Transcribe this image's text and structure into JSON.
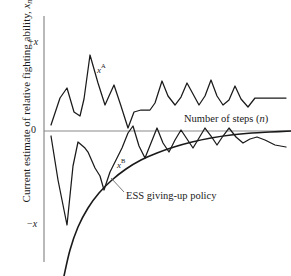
{
  "figure": {
    "background": "#ffffff",
    "line_color": "#1a1a1a",
    "axis_color": "#808080"
  },
  "axes": {
    "y_axis_title": "Current estimate of relative fighting ability, ",
    "y_axis_title_var": "x",
    "y_axis_title_sub": "n",
    "x_axis_title": "Number of steps (",
    "x_axis_title_var": "n",
    "x_axis_title_close": ")",
    "y_ticks": [
      {
        "label_prefix": "+",
        "label_var": "x",
        "value": 1,
        "y_px": 43
      },
      {
        "label_prefix": "",
        "label_var": "0",
        "value": 0,
        "y_px": 131
      },
      {
        "label_prefix": "−",
        "label_var": "x",
        "value": -1,
        "y_px": 225
      }
    ],
    "x_range_px": [
      44,
      291
    ],
    "y_axis_x_px": 44,
    "zero_line_y_px": 131
  },
  "annotations": {
    "series_a_label_var": "x",
    "series_a_label_sup": "A",
    "series_a_label_pos": [
      97,
      62
    ],
    "series_b_label_var": "x",
    "series_b_label_sup": "B",
    "series_b_label_pos": [
      117,
      157
    ],
    "ess_label": "ESS giving-up policy",
    "ess_label_pos": [
      126,
      190
    ],
    "ess_leader_line": [
      [
        124,
        192
      ],
      [
        111,
        178
      ]
    ],
    "x_axis_label_pos": [
      184,
      113
    ]
  },
  "chart_data": {
    "type": "line",
    "title": "",
    "xlabel": "Number of steps (n)",
    "ylabel": "Current estimate of relative fighting ability, x_n",
    "xlim": [
      0,
      100
    ],
    "ylim": [
      -1.35,
      1.15
    ],
    "ytick_labels": [
      "+x",
      "0",
      "−x"
    ],
    "ytick_values": [
      1,
      0,
      -1
    ],
    "grid": false,
    "legend": "inline-annotations",
    "series": [
      {
        "name": "x^A",
        "style": "polyline",
        "comment": "Contestant A estimate; oscillates above zero, damping toward a positive plateau",
        "points_px": [
          [
            51,
            125
          ],
          [
            60,
            98
          ],
          [
            67,
            88
          ],
          [
            74,
            112
          ],
          [
            80,
            116
          ],
          [
            84,
            99
          ],
          [
            90,
            55
          ],
          [
            98,
            83
          ],
          [
            105,
            105
          ],
          [
            109,
            96
          ],
          [
            114,
            85
          ],
          [
            121,
            106
          ],
          [
            128,
            128
          ],
          [
            134,
            112
          ],
          [
            141,
            110
          ],
          [
            150,
            110
          ],
          [
            155,
            103
          ],
          [
            162,
            81
          ],
          [
            168,
            96
          ],
          [
            175,
            105
          ],
          [
            181,
            97
          ],
          [
            187,
            83
          ],
          [
            193,
            94
          ],
          [
            199,
            105
          ],
          [
            205,
            96
          ],
          [
            211,
            80
          ],
          [
            217,
            96
          ],
          [
            223,
            105
          ],
          [
            229,
            100
          ],
          [
            235,
            86
          ],
          [
            241,
            99
          ],
          [
            248,
            107
          ],
          [
            255,
            98
          ],
          [
            262,
            98
          ],
          [
            275,
            98
          ],
          [
            286,
            98
          ]
        ],
        "x_values": [
          0,
          3,
          5,
          8,
          10,
          12,
          14,
          17,
          20,
          22,
          24,
          27,
          30,
          32,
          35,
          38,
          40,
          43,
          45,
          48,
          50,
          52,
          55,
          57,
          60,
          62,
          65,
          67,
          70,
          72,
          75,
          77,
          80,
          83,
          87,
          92
        ],
        "y_values": [
          0.07,
          0.37,
          0.49,
          0.22,
          0.17,
          0.36,
          0.86,
          0.54,
          0.29,
          0.4,
          0.52,
          0.28,
          0.03,
          0.22,
          0.24,
          0.24,
          0.32,
          0.57,
          0.4,
          0.29,
          0.39,
          0.55,
          0.42,
          0.29,
          0.4,
          0.58,
          0.4,
          0.29,
          0.35,
          0.51,
          0.36,
          0.27,
          0.38,
          0.38,
          0.38,
          0.38
        ]
      },
      {
        "name": "x^B",
        "style": "polyline",
        "comment": "Contestant B estimate; starts strongly negative, damping toward zero from below",
        "points_px": [
          [
            51,
            136
          ],
          [
            58,
            180
          ],
          [
            67,
            225
          ],
          [
            73,
            166
          ],
          [
            78,
            142
          ],
          [
            85,
            148
          ],
          [
            88,
            152
          ],
          [
            95,
            168
          ],
          [
            100,
            176
          ],
          [
            104,
            190
          ],
          [
            110,
            172
          ],
          [
            116,
            160
          ],
          [
            122,
            148
          ],
          [
            128,
            133
          ],
          [
            133,
            126
          ],
          [
            139,
            146
          ],
          [
            145,
            158
          ],
          [
            151,
            143
          ],
          [
            157,
            128
          ],
          [
            163,
            143
          ],
          [
            169,
            152
          ],
          [
            175,
            140
          ],
          [
            181,
            130
          ],
          [
            187,
            139
          ],
          [
            193,
            148
          ],
          [
            199,
            138
          ],
          [
            205,
            128
          ],
          [
            211,
            136
          ],
          [
            217,
            145
          ],
          [
            223,
            136
          ],
          [
            229,
            128
          ],
          [
            236,
            137
          ],
          [
            243,
            143
          ],
          [
            250,
            139
          ],
          [
            257,
            137
          ],
          [
            265,
            140
          ],
          [
            275,
            145
          ],
          [
            286,
            147
          ]
        ],
        "x_values": [
          0,
          3,
          5,
          8,
          10,
          13,
          15,
          18,
          20,
          23,
          25,
          27,
          30,
          32,
          35,
          37,
          40,
          42,
          45,
          47,
          50,
          52,
          55,
          57,
          60,
          62,
          65,
          67,
          70,
          72,
          75,
          77,
          80,
          83,
          85,
          88,
          92,
          96
        ],
        "y_values": [
          -0.05,
          -0.53,
          -1.0,
          -0.37,
          -0.12,
          -0.19,
          -0.23,
          -0.41,
          -0.5,
          -0.66,
          -0.46,
          -0.32,
          -0.19,
          -0.02,
          0.05,
          -0.17,
          -0.3,
          -0.13,
          0.03,
          -0.13,
          -0.23,
          -0.1,
          0.01,
          -0.09,
          -0.19,
          -0.08,
          0.03,
          -0.06,
          -0.15,
          -0.06,
          0.03,
          -0.07,
          -0.13,
          -0.09,
          -0.07,
          -0.1,
          -0.15,
          -0.18
        ]
      },
      {
        "name": "ESS giving-up policy",
        "style": "smooth-curve",
        "comment": "Monotone increasing concave threshold curve rising from lower-left toward zero",
        "points_px": [
          [
            64,
            276
          ],
          [
            70,
            250
          ],
          [
            78,
            227
          ],
          [
            88,
            208
          ],
          [
            99,
            193
          ],
          [
            112,
            180
          ],
          [
            126,
            169
          ],
          [
            141,
            160
          ],
          [
            157,
            153
          ],
          [
            174,
            147
          ],
          [
            192,
            142
          ],
          [
            211,
            138
          ],
          [
            231,
            135
          ],
          [
            252,
            133
          ],
          [
            270,
            132
          ],
          [
            291,
            131
          ]
        ],
        "x_values": [
          5,
          8,
          11,
          15,
          19,
          24,
          29,
          35,
          41,
          47,
          54,
          61,
          69,
          77,
          84,
          92
        ],
        "y_values": [
          -1.55,
          -1.27,
          -1.02,
          -0.82,
          -0.66,
          -0.52,
          -0.41,
          -0.31,
          -0.24,
          -0.17,
          -0.12,
          -0.08,
          -0.04,
          -0.02,
          -0.01,
          0.0
        ]
      }
    ]
  }
}
